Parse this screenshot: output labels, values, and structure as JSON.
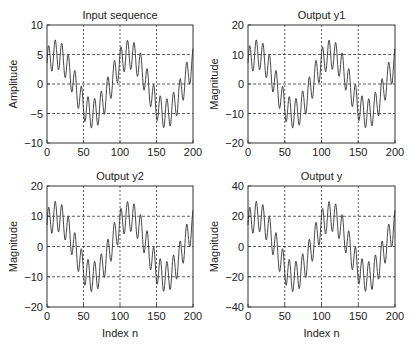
{
  "figure": {
    "background": "#ffffff",
    "line_color": "#333333",
    "grid_color": "#333333"
  },
  "chart_data": [
    {
      "type": "line",
      "title": "Input sequence",
      "xlabel": "",
      "ylabel": "Amplitude",
      "xlim": [
        0,
        200
      ],
      "ylim": [
        -10,
        10
      ],
      "xticks": [
        0,
        50,
        100,
        150,
        200
      ],
      "yticks": [
        -10,
        -5,
        0,
        5,
        10
      ],
      "ytick_labels": [
        "−10",
        "−5",
        "0",
        "5",
        "10"
      ],
      "grid": true,
      "grid_style": "dashed",
      "series": [
        {
          "name": "x[n]",
          "formula": "5*sin(2*pi*n/100 + pi/4) + 2.5*sin(2*pi*n/9)",
          "amplitude_scale": 1,
          "n_range": [
            0,
            200
          ],
          "approx_range": [
            -8,
            8
          ]
        }
      ],
      "box": {
        "left": 47,
        "top": 25,
        "right": 193,
        "bottom": 143
      }
    },
    {
      "type": "line",
      "title": "Output y1",
      "xlabel": "",
      "ylabel": "Magnitude",
      "xlim": [
        0,
        200
      ],
      "ylim": [
        -20,
        20
      ],
      "xticks": [
        0,
        50,
        100,
        150,
        200
      ],
      "yticks": [
        -20,
        -10,
        0,
        10,
        20
      ],
      "ytick_labels": [
        "−20",
        "−10",
        "0",
        "10",
        "20"
      ],
      "grid": true,
      "grid_style": "dashed",
      "series": [
        {
          "name": "y1[n]",
          "formula": "2 * x[n]",
          "amplitude_scale": 2,
          "n_range": [
            0,
            200
          ],
          "approx_range": [
            -14,
            14
          ]
        }
      ],
      "box": {
        "left": 248,
        "top": 25,
        "right": 395,
        "bottom": 143
      }
    },
    {
      "type": "line",
      "title": "Output y2",
      "xlabel": "Index n",
      "ylabel": "Magnitude",
      "xlim": [
        0,
        200
      ],
      "ylim": [
        -20,
        20
      ],
      "xticks": [
        0,
        50,
        100,
        150,
        200
      ],
      "yticks": [
        -20,
        -10,
        0,
        10,
        20
      ],
      "ytick_labels": [
        "−20",
        "−10",
        "0",
        "10",
        "20"
      ],
      "grid": true,
      "grid_style": "dashed",
      "series": [
        {
          "name": "y2[n]",
          "formula": "2 * x[n]",
          "amplitude_scale": 2,
          "n_range": [
            0,
            200
          ],
          "approx_range": [
            -14,
            14
          ]
        }
      ],
      "box": {
        "left": 47,
        "top": 186,
        "right": 193,
        "bottom": 307
      }
    },
    {
      "type": "line",
      "title": "Output y",
      "xlabel": "Index n",
      "ylabel": "Magnitude",
      "xlim": [
        0,
        200
      ],
      "ylim": [
        -40,
        40
      ],
      "xticks": [
        0,
        50,
        100,
        150,
        200
      ],
      "yticks": [
        -40,
        -20,
        0,
        20,
        40
      ],
      "ytick_labels": [
        "−40",
        "−20",
        "0",
        "20",
        "40"
      ],
      "grid": true,
      "grid_style": "dashed",
      "series": [
        {
          "name": "y[n]",
          "formula": "4 * x[n]",
          "amplitude_scale": 4,
          "n_range": [
            0,
            200
          ],
          "approx_range": [
            -28,
            28
          ]
        }
      ],
      "box": {
        "left": 248,
        "top": 186,
        "right": 395,
        "bottom": 307
      }
    }
  ]
}
